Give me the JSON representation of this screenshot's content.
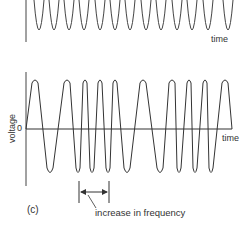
{
  "figure": {
    "panel_label": "(c)",
    "top_plot": {
      "x_axis_label": "time"
    },
    "bottom_plot": {
      "x_axis_label": "time",
      "y_axis_label": "voltage",
      "y_zero_label": "0",
      "annotation": "increase in frequency"
    }
  },
  "waveform": {
    "top_trough_x": [
      39,
      54,
      69,
      84,
      100,
      115,
      130,
      146,
      161,
      177,
      192,
      208,
      228
    ],
    "bottom_peak_x": [
      35,
      67,
      85,
      100,
      115,
      143,
      172,
      189,
      205,
      225
    ],
    "bottom_trough_x": [
      50,
      78,
      92,
      108,
      127,
      160,
      179,
      195,
      211
    ],
    "line_color": "#333333"
  }
}
